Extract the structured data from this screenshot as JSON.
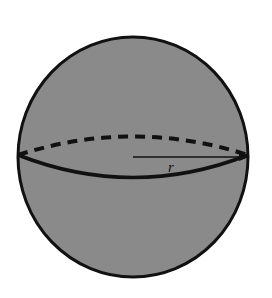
{
  "figure": {
    "shape": "sphere",
    "fill_color": "#8a8a8a",
    "stroke_color": "#111111",
    "radius_label": "r"
  }
}
